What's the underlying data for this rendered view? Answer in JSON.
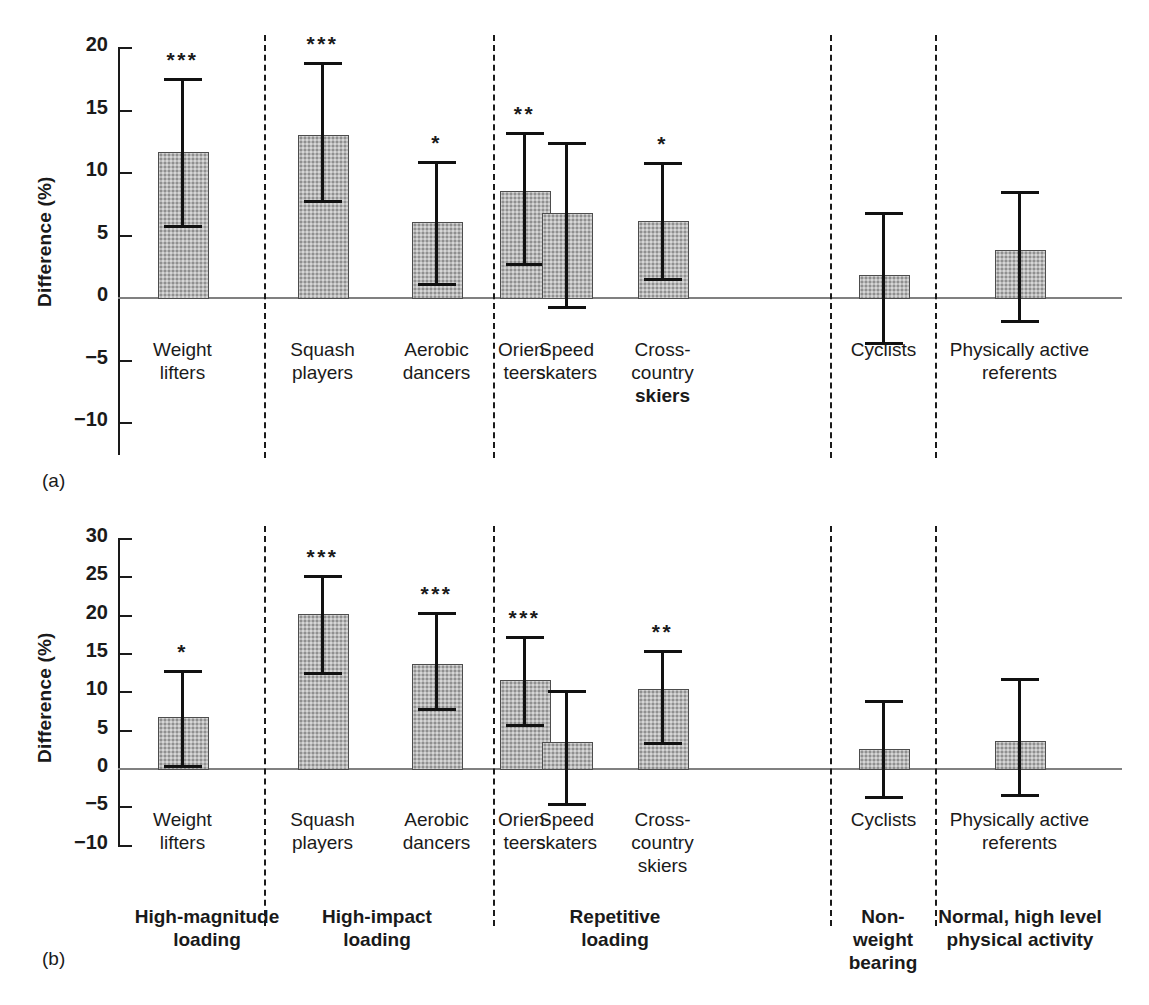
{
  "figure": {
    "panel_a_tag": "(a)",
    "panel_b_tag": "(b)",
    "y_axis_label": "Difference (%)"
  },
  "panel_a": {
    "tag": "(a)",
    "ylabel": "Difference (%)",
    "yticks": [
      "20",
      "15",
      "10",
      "5",
      "0",
      "−5",
      "−10"
    ]
  },
  "panel_b": {
    "tag": "(b)",
    "ylabel": "Difference (%)",
    "yticks": [
      "30",
      "25",
      "20",
      "15",
      "10",
      "5",
      "0",
      "−5",
      "−10"
    ]
  },
  "categories": [
    {
      "line1": "Weight",
      "line2": "lifters"
    },
    {
      "line1": "Squash",
      "line2": "players"
    },
    {
      "line1": "Aerobic",
      "line2": "dancers"
    },
    {
      "line1": "Orien-",
      "line2": "teers"
    },
    {
      "line1": "Speed",
      "line2": "skaters"
    },
    {
      "line1": "Cross-",
      "line2": "country",
      "line3": "skiers"
    },
    {
      "line1": "Cyclists",
      "line2": ""
    },
    {
      "line1": "Physically active",
      "line2": "referents"
    }
  ],
  "groups": [
    {
      "line1": "High-magnitude",
      "line2": "loading"
    },
    {
      "line1": "High-impact",
      "line2": "loading"
    },
    {
      "line1": "Repetitive",
      "line2": "loading"
    },
    {
      "line1": "Non-",
      "line2": "weight",
      "line3": "bearing"
    },
    {
      "line1": "Normal, high level",
      "line2": "physical activity"
    }
  ],
  "chart_data": [
    {
      "type": "bar",
      "panel": "(a)",
      "title": "",
      "xlabel": "",
      "ylabel": "Difference (%)",
      "ylim": [
        -10,
        20
      ],
      "yticks": [
        20,
        15,
        10,
        5,
        0,
        -5,
        -10
      ],
      "grid": false,
      "legend": "none",
      "categories": [
        "Weight lifters",
        "Squash players",
        "Aerobic dancers",
        "Orienteers",
        "Speed skaters",
        "Cross-country skiers",
        "Cyclists",
        "Physically active referents"
      ],
      "values": [
        11.6,
        13.0,
        6.0,
        8.5,
        6.7,
        6.1,
        1.8,
        3.8
      ],
      "err_upper": [
        17.5,
        18.8,
        10.9,
        13.2,
        12.4,
        10.8,
        6.8,
        8.5
      ],
      "err_lower": [
        5.8,
        7.8,
        1.1,
        2.7,
        -0.7,
        1.5,
        -3.6,
        -1.8
      ],
      "significance": [
        "***",
        "***",
        "*",
        "**",
        "",
        "*",
        "",
        ""
      ],
      "group_membership": [
        "High-magnitude loading",
        "High-impact loading",
        "High-impact loading",
        "Repetitive loading",
        "Repetitive loading",
        "Repetitive loading",
        "Non-weight bearing",
        "Normal, high level physical activity"
      ]
    },
    {
      "type": "bar",
      "panel": "(b)",
      "title": "",
      "xlabel": "",
      "ylabel": "Difference (%)",
      "ylim": [
        -10,
        30
      ],
      "yticks": [
        30,
        25,
        20,
        15,
        10,
        5,
        0,
        -5,
        -10
      ],
      "grid": false,
      "legend": "none",
      "categories": [
        "Weight lifters",
        "Squash players",
        "Aerobic dancers",
        "Orienteers",
        "Speed skaters",
        "Cross-country skiers",
        "Cyclists",
        "Physically active referents"
      ],
      "values": [
        6.7,
        20.1,
        13.6,
        11.5,
        3.4,
        10.3,
        2.5,
        3.5
      ],
      "err_upper": [
        12.8,
        25.2,
        20.3,
        17.2,
        10.2,
        15.4,
        8.9,
        11.7
      ],
      "err_lower": [
        0.4,
        12.5,
        7.8,
        5.8,
        -4.5,
        3.4,
        -3.6,
        -3.4
      ],
      "significance": [
        "*",
        "***",
        "***",
        "***",
        "",
        "**",
        "",
        ""
      ],
      "group_membership": [
        "High-magnitude loading",
        "High-impact loading",
        "High-impact loading",
        "Repetitive loading",
        "Repetitive loading",
        "Repetitive loading",
        "Non-weight bearing",
        "Normal, high level physical activity"
      ]
    }
  ]
}
